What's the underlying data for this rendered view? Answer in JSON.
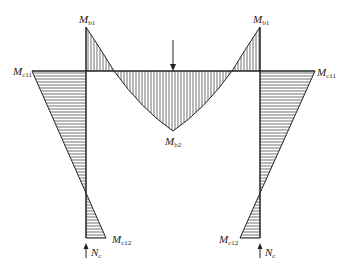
{
  "diagram": {
    "type": "bending moment diagram of portal frame",
    "labels": {
      "mb1_left": {
        "main": "M",
        "sub": "b1"
      },
      "mb1_right": {
        "main": "M",
        "sub": "b1"
      },
      "mc11_left": {
        "main": "M",
        "sub": "c11"
      },
      "mc11_right": {
        "main": "M",
        "sub": "c11"
      },
      "mb2": {
        "main": "M",
        "sub": "b2"
      },
      "mc12_left": {
        "main": "M",
        "sub": "c12"
      },
      "mc12_right": {
        "main": "M",
        "sub": "c12"
      },
      "nc_left": {
        "main": "N",
        "sub": "c"
      },
      "nc_right": {
        "main": "N",
        "sub": "c"
      }
    },
    "loads": {
      "beam_point_load": "downward arrow at beam midspan",
      "column_axial": "upward arrows Nc at column bases"
    },
    "colors": {
      "line": "#222222",
      "background": "#ffffff"
    }
  }
}
